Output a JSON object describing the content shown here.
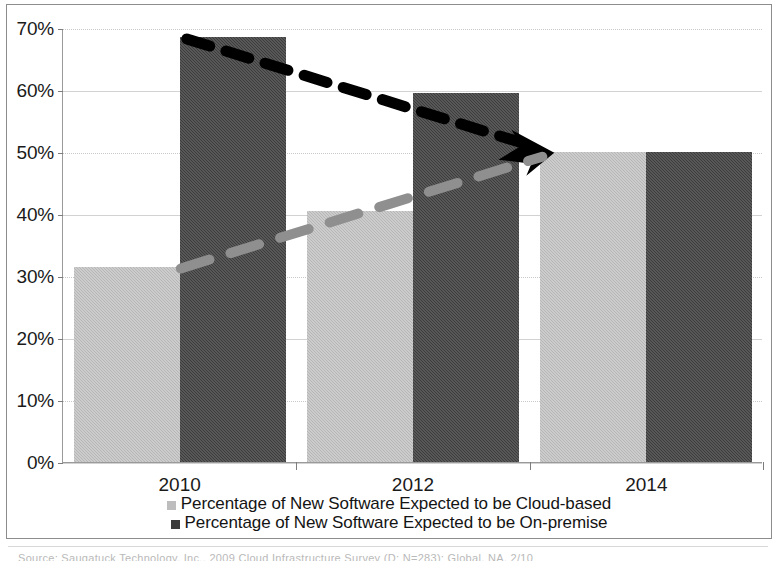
{
  "chart_data": {
    "type": "bar",
    "title": "",
    "subtitle": "",
    "xlabel": "",
    "ylabel": "",
    "categories": [
      "2010",
      "2012",
      "2014"
    ],
    "series": [
      {
        "name": "Percentage of New Software Expected to be Cloud-based",
        "color": "#b6b6b6",
        "values": [
          31.5,
          40.5,
          50.0
        ]
      },
      {
        "name": "Percentage of New Software Expected to be On-premise",
        "color": "#3c3c3c",
        "values": [
          68.5,
          59.5,
          50.0
        ]
      }
    ],
    "ylim": [
      0,
      70
    ],
    "ytick_values": [
      0,
      10,
      20,
      30,
      40,
      50,
      60,
      70
    ],
    "ytick_labels": [
      "0%",
      "10%",
      "20%",
      "30%",
      "40%",
      "50%",
      "60%",
      "70%"
    ],
    "grid": true,
    "legend_position": "bottom",
    "annotations": [
      {
        "name": "on-premise-trendline",
        "style": "thick-dashed",
        "color": "#000000",
        "arrow": true,
        "from": {
          "x_category": "2010",
          "y": 68.5
        },
        "to": {
          "x_category": "2014",
          "y": 50.0
        }
      },
      {
        "name": "cloud-trendline",
        "style": "thick-dashed",
        "color": "#8f8f8f",
        "arrow": false,
        "from": {
          "x_category": "2010",
          "y": 31.5
        },
        "to": {
          "x_category": "2014",
          "y": 50.0
        }
      }
    ]
  },
  "axis": {
    "y_labels": [
      "70%",
      "60%",
      "50%",
      "40%",
      "30%",
      "20%",
      "10%",
      "0%"
    ],
    "x_labels": [
      "2010",
      "2012",
      "2014"
    ]
  },
  "legend": {
    "items": [
      {
        "label": "Percentage of New Software Expected to be Cloud-based",
        "swatch": "cloud"
      },
      {
        "label": "Percentage of New Software Expected to be On-premise",
        "swatch": "onprem"
      }
    ]
  },
  "caption": {
    "source_text": "Source: Saugatuck Technology, Inc., 2009 Cloud Infrastructure Survey (D; N=283); Global, NA, 2/10"
  },
  "colors": {
    "cloud_bar": "#b6b6b6",
    "onprem_bar": "#3c3c3c",
    "trend_dark": "#000000",
    "trend_light": "#8f8f8f",
    "grid": "#c9c9c9",
    "frame": "#8d8d8d"
  }
}
